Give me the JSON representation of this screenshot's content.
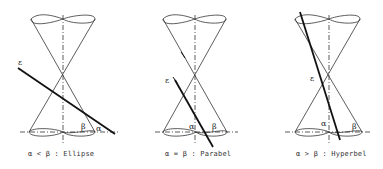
{
  "figure": {
    "panels": [
      {
        "id": "ellipse",
        "caption": "α < β : Ellipse",
        "plane_label": "ε",
        "angle_labels": [
          "β",
          "α"
        ]
      },
      {
        "id": "parabola",
        "caption": "α = β : Parabel",
        "plane_label": "ε",
        "angle_labels": [
          "α",
          "β"
        ]
      },
      {
        "id": "hyperbola",
        "caption": "α > β : Hyperbel",
        "plane_label": "ε",
        "angle_labels": [
          "α",
          "β"
        ]
      }
    ],
    "colors": {
      "line": "#222222",
      "background": "#ffffff"
    }
  }
}
